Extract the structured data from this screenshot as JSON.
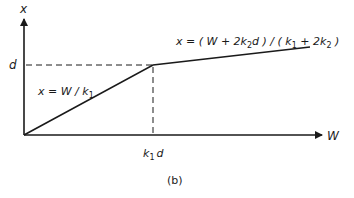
{
  "figure": {
    "caption": "(b)",
    "axes": {
      "y_label": "x",
      "x_label": "W"
    },
    "ticks": {
      "y_tick": "d",
      "x_tick_main": "k",
      "x_tick_sub": "1",
      "x_tick_tail": "d"
    },
    "equations": {
      "left": {
        "prefix": "x = W / k",
        "sub": "1"
      },
      "right": {
        "part1": "x = ( W + 2k",
        "sub1": "2",
        "part2": "d ) / ( k",
        "sub2": "1",
        "part3": " + 2k",
        "sub3": "2",
        "part4": " )"
      }
    },
    "colors": {
      "line": "#1a1a1a",
      "background": "#ffffff"
    }
  }
}
